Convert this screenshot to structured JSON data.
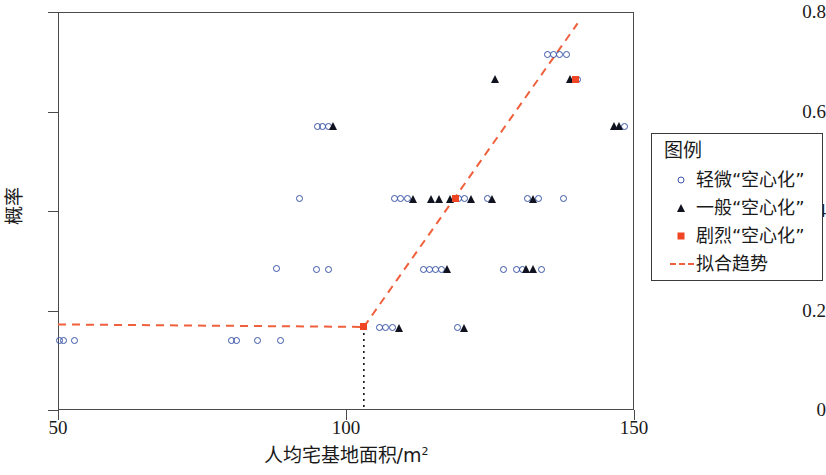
{
  "chart_data": {
    "type": "scatter",
    "title": "",
    "xlabel": "人均宅基地面积/m²",
    "ylabel": "概率",
    "xlim": [
      50,
      150
    ],
    "ylim": [
      0,
      0.8
    ],
    "xticks": [
      "50",
      "100",
      "150"
    ],
    "xtick_values": [
      50,
      100,
      150
    ],
    "yticks": [
      "0",
      "0.2",
      "0.4",
      "0.6",
      "0.8"
    ],
    "ytick_values": [
      0,
      0.2,
      0.4,
      0.6,
      0.8
    ],
    "grid": false,
    "legend_position": "right-outside",
    "colors": {
      "slight_marker": "#3a55a8",
      "general_marker": "#10131f",
      "severe_marker": "#ef4522",
      "trend_line": "#f0603c",
      "axis": "#4a4a4a",
      "breakpoint_guide": "#111111"
    },
    "series": [
      {
        "name": "轻微“空心化”",
        "marker": "open-circle",
        "color": "#3a55a8",
        "points": [
          [
            50.3,
            0.14
          ],
          [
            50.9,
            0.14
          ],
          [
            52.9,
            0.14
          ],
          [
            80.2,
            0.14
          ],
          [
            81.0,
            0.14
          ],
          [
            84.6,
            0.14
          ],
          [
            88.6,
            0.14
          ],
          [
            88.0,
            0.285
          ],
          [
            94.9,
            0.283
          ],
          [
            96.9,
            0.283
          ],
          [
            95.0,
            0.57
          ],
          [
            96.0,
            0.57
          ],
          [
            97.0,
            0.57
          ],
          [
            92.0,
            0.425
          ],
          [
            105.8,
            0.165
          ],
          [
            106.8,
            0.165
          ],
          [
            108.0,
            0.165
          ],
          [
            119.3,
            0.165
          ],
          [
            108.4,
            0.425
          ],
          [
            109.4,
            0.425
          ],
          [
            110.6,
            0.425
          ],
          [
            119.5,
            0.425
          ],
          [
            120.5,
            0.425
          ],
          [
            113.5,
            0.283
          ],
          [
            114.5,
            0.283
          ],
          [
            115.5,
            0.283
          ],
          [
            116.5,
            0.283
          ],
          [
            124.6,
            0.425
          ],
          [
            127.4,
            0.283
          ],
          [
            129.6,
            0.283
          ],
          [
            130.6,
            0.283
          ],
          [
            134.0,
            0.283
          ],
          [
            131.5,
            0.425
          ],
          [
            133.5,
            0.425
          ],
          [
            137.7,
            0.425
          ],
          [
            135.0,
            0.715
          ],
          [
            136.0,
            0.715
          ],
          [
            137.0,
            0.715
          ],
          [
            138.2,
            0.715
          ],
          [
            140.2,
            0.665
          ],
          [
            148.3,
            0.57
          ]
        ]
      },
      {
        "name": "一般“空心化”",
        "marker": "filled-triangle",
        "color": "#10131f",
        "points": [
          [
            97.8,
            0.57
          ],
          [
            109.3,
            0.165
          ],
          [
            120.6,
            0.165
          ],
          [
            111.8,
            0.425
          ],
          [
            114.8,
            0.425
          ],
          [
            116.2,
            0.425
          ],
          [
            118.2,
            0.425
          ],
          [
            121.8,
            0.425
          ],
          [
            117.6,
            0.283
          ],
          [
            125.9,
            0.665
          ],
          [
            125.4,
            0.425
          ],
          [
            132.6,
            0.425
          ],
          [
            131.3,
            0.283
          ],
          [
            132.6,
            0.283
          ],
          [
            139.0,
            0.665
          ],
          [
            146.6,
            0.57
          ],
          [
            147.5,
            0.57
          ]
        ]
      },
      {
        "name": "剧烈“空心化”",
        "marker": "filled-square",
        "color": "#ef4522",
        "points": [
          [
            103.1,
            0.167
          ],
          [
            119.0,
            0.425
          ],
          [
            139.8,
            0.665
          ]
        ]
      }
    ],
    "trend": {
      "name": "拟合趋势",
      "style": "dashed",
      "color": "#f0603c",
      "breakpoint": [
        103.1,
        0.167
      ],
      "segments": [
        {
          "from": [
            50.0,
            0.172
          ],
          "to": [
            103.1,
            0.167
          ]
        },
        {
          "from": [
            103.1,
            0.167
          ],
          "to": [
            140.2,
            0.777
          ]
        }
      ]
    },
    "breakpoint_guide": {
      "style": "dotted",
      "color": "#111111",
      "from": [
        103.1,
        0.167
      ],
      "to": [
        103.1,
        0.0
      ]
    }
  },
  "legend": {
    "title": "图例",
    "entries": [
      {
        "label": "轻微“空心化”",
        "symbol": "open-circle-icon"
      },
      {
        "label": "一般“空心化”",
        "symbol": "filled-triangle-icon"
      },
      {
        "label": "剧烈“空心化”",
        "symbol": "filled-square-icon"
      },
      {
        "label": "拟合趋势",
        "symbol": "dashed-line-icon"
      }
    ]
  }
}
